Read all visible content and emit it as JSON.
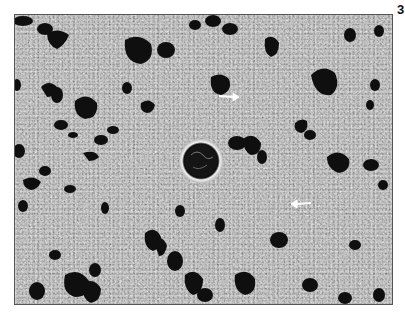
{
  "figure": {
    "label": "3",
    "image_description": "Grayscale photomicrograph of liver tissue with a central vein and scattered dark vacuoles; two white arrows mark lesions",
    "colors": {
      "background": "#ffffff",
      "tissue_mid": "#a9a9a9",
      "dark_regions": "#111111",
      "arrow": "#ffffff",
      "border": "#555555"
    },
    "arrows": [
      {
        "x": 235,
        "y": 95,
        "direction": "right"
      },
      {
        "x": 305,
        "y": 203,
        "direction": "right"
      }
    ],
    "central_vessel": {
      "cx": 200,
      "cy": 160,
      "r": 20
    }
  },
  "caption": {
    "text": "",
    "clipped": true
  }
}
